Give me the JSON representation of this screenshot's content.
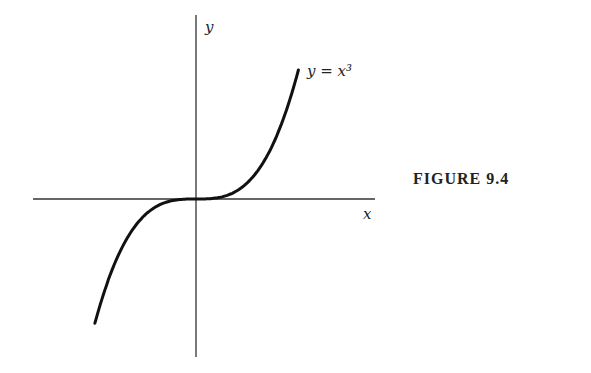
{
  "figure": {
    "caption": "FIGURE 9.4",
    "x_label": "x",
    "y_label": "y",
    "curve_label": "y = x³"
  },
  "chart_data": {
    "type": "line",
    "title": "FIGURE 9.4",
    "xlabel": "x",
    "ylabel": "y",
    "series": [
      {
        "name": "y = x³",
        "x": [
          -1.6,
          -1.2,
          -0.8,
          -0.4,
          0,
          0.4,
          0.8,
          1.2,
          1.6
        ],
        "y": [
          -4.096,
          -1.728,
          -0.512,
          -0.064,
          0,
          0.064,
          0.512,
          1.728,
          4.096
        ]
      }
    ],
    "grid": false,
    "ticks": false,
    "legend": "inline label near curve end"
  }
}
